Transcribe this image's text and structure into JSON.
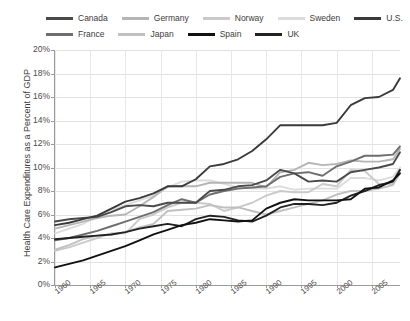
{
  "chart_data": {
    "type": "line",
    "title": "",
    "xlabel": "",
    "ylabel": "Health Care Expenditures as a Percent of GDP",
    "xlim": [
      1960,
      2009
    ],
    "ylim": [
      0,
      20
    ],
    "ytick_labels": [
      "20%",
      "18%",
      "16%",
      "14%",
      "12%",
      "10%",
      "8%",
      "6%",
      "4%",
      "2%",
      "0%"
    ],
    "ytick_values": [
      20,
      18,
      16,
      14,
      12,
      10,
      8,
      6,
      4,
      2,
      0
    ],
    "xtick_labels": [
      "1960",
      "1965",
      "1970",
      "1975",
      "1980",
      "1985",
      "1990",
      "1995",
      "2000",
      "2005"
    ],
    "xtick_values": [
      1960,
      1965,
      1970,
      1975,
      1980,
      1985,
      1990,
      1995,
      2000,
      2005
    ],
    "grid": "horizontal-and-vertical",
    "legend_position": "top",
    "x": [
      1960,
      1962,
      1964,
      1966,
      1968,
      1970,
      1972,
      1974,
      1976,
      1978,
      1980,
      1982,
      1984,
      1986,
      1988,
      1990,
      1992,
      1994,
      1996,
      1998,
      2000,
      2002,
      2004,
      2006,
      2008,
      2009
    ],
    "series": [
      {
        "name": "Canada",
        "color": "#4a4a4a",
        "values": [
          5.4,
          5.6,
          5.7,
          5.8,
          6.2,
          6.7,
          6.8,
          6.7,
          7.0,
          7.0,
          7.0,
          8.0,
          8.1,
          8.4,
          8.5,
          8.9,
          9.8,
          9.5,
          8.8,
          8.9,
          8.8,
          9.6,
          9.8,
          10.0,
          10.3,
          11.3
        ]
      },
      {
        "name": "Germany",
        "color": "#b5b5b5",
        "values": [
          4.8,
          5.1,
          5.4,
          5.7,
          5.9,
          6.0,
          6.7,
          7.5,
          8.4,
          8.4,
          8.4,
          8.7,
          8.7,
          8.7,
          8.7,
          8.3,
          9.6,
          9.8,
          10.4,
          10.2,
          10.3,
          10.6,
          10.5,
          10.5,
          10.7,
          11.6
        ]
      },
      {
        "name": "Norway",
        "color": "#cacaca"
      },
      {
        "name": "Sweden",
        "color": "#dcdcdc",
        "values": [
          4.4,
          4.8,
          5.2,
          5.9,
          6.4,
          6.8,
          7.2,
          7.6,
          8.3,
          8.8,
          8.9,
          8.9,
          8.6,
          8.3,
          8.2,
          8.2,
          8.4,
          8.1,
          8.2,
          8.2,
          8.2,
          9.1,
          9.1,
          8.9,
          9.2,
          10.0
        ]
      },
      {
        "name": "U.S.",
        "color": "#3a3a3a",
        "values": [
          5.1,
          5.3,
          5.6,
          5.9,
          6.5,
          7.1,
          7.4,
          7.8,
          8.4,
          8.4,
          9.0,
          10.1,
          10.3,
          10.7,
          11.4,
          12.4,
          13.6,
          13.6,
          13.6,
          13.6,
          13.8,
          15.3,
          15.9,
          16.0,
          16.6,
          17.6
        ]
      },
      {
        "name": "France",
        "color": "#6e6e6e",
        "values": [
          3.8,
          4.0,
          4.3,
          4.6,
          5.0,
          5.4,
          5.8,
          6.2,
          6.8,
          7.3,
          7.0,
          7.7,
          8.0,
          8.2,
          8.3,
          8.4,
          9.2,
          9.5,
          9.6,
          9.3,
          10.1,
          10.5,
          11.0,
          11.0,
          11.1,
          11.8
        ]
      },
      {
        "name": "Japan",
        "color": "#c0c0c0",
        "values": [
          3.0,
          3.4,
          3.9,
          4.2,
          4.3,
          4.5,
          4.9,
          5.2,
          6.3,
          6.4,
          6.5,
          6.8,
          6.6,
          6.6,
          6.3,
          6.0,
          6.3,
          6.6,
          6.9,
          7.2,
          7.7,
          8.0,
          8.0,
          8.2,
          8.5,
          9.5
        ]
      },
      {
        "name": "Spain",
        "color": "#111111",
        "values": [
          1.5,
          1.8,
          2.1,
          2.5,
          2.9,
          3.3,
          3.8,
          4.3,
          4.7,
          5.1,
          5.3,
          5.6,
          5.5,
          5.4,
          5.5,
          6.5,
          7.0,
          7.3,
          7.2,
          7.2,
          7.2,
          7.3,
          8.2,
          8.3,
          8.9,
          9.5
        ]
      },
      {
        "name": "UK",
        "color": "#222222",
        "values": [
          3.9,
          4.0,
          4.1,
          4.2,
          4.3,
          4.5,
          4.8,
          5.0,
          5.2,
          5.0,
          5.6,
          5.9,
          5.8,
          5.5,
          5.4,
          5.9,
          6.6,
          6.9,
          6.9,
          6.8,
          7.0,
          7.6,
          8.0,
          8.5,
          8.8,
          9.8
        ]
      }
    ],
    "norway_values": [
      2.9,
      3.2,
      3.6,
      4.0,
      4.4,
      4.4,
      5.6,
      6.0,
      6.6,
      7.0,
      7.0,
      6.9,
      6.3,
      6.6,
      7.0,
      7.6,
      8.0,
      7.9,
      7.9,
      8.6,
      8.4,
      9.8,
      9.7,
      8.6,
      8.6,
      9.7
    ],
    "annotations": []
  },
  "legend": {
    "rows": [
      [
        {
          "label": "Canada",
          "color": "#4a4a4a"
        },
        {
          "label": "Germany",
          "color": "#b5b5b5"
        },
        {
          "label": "Norway",
          "color": "#cacaca"
        },
        {
          "label": "Sweden",
          "color": "#dcdcdc"
        },
        {
          "label": "U.S.",
          "color": "#3a3a3a"
        }
      ],
      [
        {
          "label": "France",
          "color": "#6e6e6e"
        },
        {
          "label": "Japan",
          "color": "#c0c0c0"
        },
        {
          "label": "Spain",
          "color": "#111111"
        },
        {
          "label": "UK",
          "color": "#222222"
        }
      ]
    ]
  },
  "axes": {
    "y_title": "Health Care Expenditures as a Percent of GDP"
  }
}
